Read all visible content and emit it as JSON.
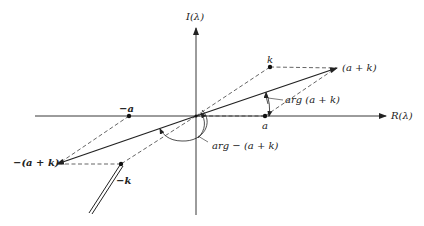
{
  "diagram": {
    "title": "",
    "axes": {
      "vertical_label": "I(λ)",
      "horizontal_label": "R(λ)"
    },
    "points": {
      "k": "k",
      "a_plus_k": "(a + k)",
      "a": "a",
      "neg_a": "−a",
      "neg_a_plus_k": "−(a + k)",
      "neg_k": "−k"
    },
    "angle_labels": {
      "arg_a_plus_k": "arg (a + k)",
      "arg_neg_a_plus_k": "arg − (a + k)"
    },
    "colors": {
      "ink": "#222222",
      "background": "#ffffff"
    }
  }
}
